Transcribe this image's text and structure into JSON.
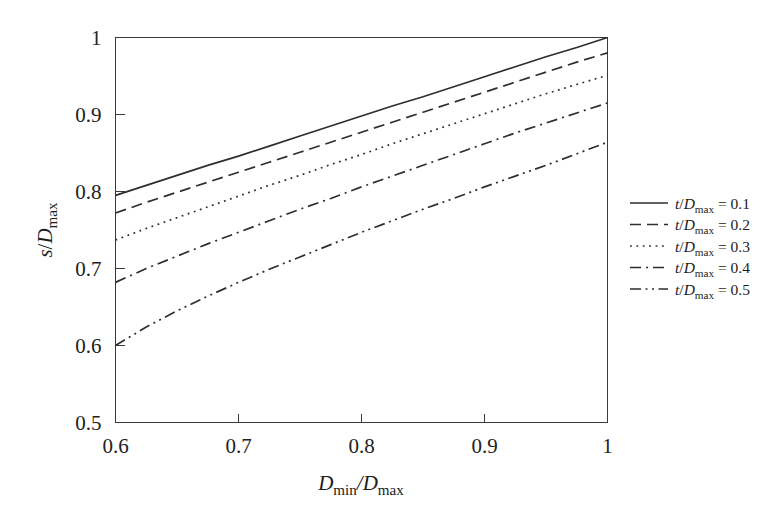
{
  "figure": {
    "background_color": "#ffffff",
    "ink_color": "#2e2e2e"
  },
  "axes": {
    "x_label_parts": {
      "main1": "D",
      "sub1": "min",
      "slash": "/",
      "main2": "D",
      "sub2": "max"
    },
    "y_label_parts": {
      "main1": "s",
      "slash": "/",
      "main2": "D",
      "sub2": "max"
    },
    "x_ticks": [
      "0.6",
      "0.7",
      "0.8",
      "0.9",
      "1"
    ],
    "y_ticks": [
      "0.5",
      "0.6",
      "0.7",
      "0.8",
      "0.9",
      "1"
    ],
    "xlim": [
      0.6,
      1.0
    ],
    "ylim": [
      0.5,
      1.0
    ]
  },
  "legend": {
    "items": [
      {
        "label_main": "t",
        "label_slash": "/",
        "label_d": "D",
        "label_sub": "max",
        "label_eq": "= 0.1",
        "style": "solid"
      },
      {
        "label_main": "t",
        "label_slash": "/",
        "label_d": "D",
        "label_sub": "max",
        "label_eq": "= 0.2",
        "style": "dashed"
      },
      {
        "label_main": "t",
        "label_slash": "/",
        "label_d": "D",
        "label_sub": "max",
        "label_eq": "= 0.3",
        "style": "dotted"
      },
      {
        "label_main": "t",
        "label_slash": "/",
        "label_d": "D",
        "label_sub": "max",
        "label_eq": "= 0.4",
        "style": "dashdot"
      },
      {
        "label_main": "t",
        "label_slash": "/",
        "label_d": "D",
        "label_sub": "max",
        "label_eq": "= 0.5",
        "style": "dashdotdot"
      }
    ]
  },
  "chart_data": {
    "type": "line",
    "title": "",
    "xlabel": "D_min/D_max",
    "ylabel": "s/D_max",
    "xlim": [
      0.6,
      1.0
    ],
    "ylim": [
      0.5,
      1.0
    ],
    "xticks": [
      0.6,
      0.7,
      0.8,
      0.9,
      1.0
    ],
    "yticks": [
      0.5,
      0.6,
      0.7,
      0.8,
      0.9,
      1.0
    ],
    "grid": false,
    "legend_position": "right-outside",
    "x": [
      0.6,
      0.625,
      0.65,
      0.675,
      0.7,
      0.725,
      0.75,
      0.775,
      0.8,
      0.825,
      0.85,
      0.875,
      0.9,
      0.925,
      0.95,
      0.975,
      1.0
    ],
    "series": [
      {
        "name": "t/D_max = 0.1",
        "dash": "solid",
        "values": [
          0.795,
          0.808,
          0.821,
          0.834,
          0.846,
          0.859,
          0.872,
          0.885,
          0.898,
          0.911,
          0.923,
          0.936,
          0.949,
          0.962,
          0.975,
          0.987,
          1.0
        ]
      },
      {
        "name": "t/D_max = 0.2",
        "dash": "dashed",
        "values": [
          0.772,
          0.786,
          0.799,
          0.812,
          0.825,
          0.838,
          0.851,
          0.864,
          0.877,
          0.89,
          0.903,
          0.916,
          0.929,
          0.942,
          0.955,
          0.968,
          0.98
        ]
      },
      {
        "name": "t/D_max = 0.3",
        "dash": "dotted",
        "values": [
          0.737,
          0.752,
          0.766,
          0.78,
          0.794,
          0.808,
          0.821,
          0.835,
          0.848,
          0.862,
          0.875,
          0.888,
          0.901,
          0.914,
          0.927,
          0.939,
          0.951
        ]
      },
      {
        "name": "t/D_max = 0.4",
        "dash": "dashdot",
        "values": [
          0.682,
          0.7,
          0.716,
          0.732,
          0.747,
          0.762,
          0.777,
          0.791,
          0.806,
          0.82,
          0.834,
          0.848,
          0.862,
          0.876,
          0.889,
          0.902,
          0.915
        ]
      },
      {
        "name": "t/D_max = 0.5",
        "dash": "dashdotdot",
        "values": [
          0.6,
          0.624,
          0.645,
          0.664,
          0.682,
          0.699,
          0.715,
          0.731,
          0.747,
          0.762,
          0.777,
          0.791,
          0.806,
          0.82,
          0.834,
          0.849,
          0.864
        ]
      }
    ]
  }
}
